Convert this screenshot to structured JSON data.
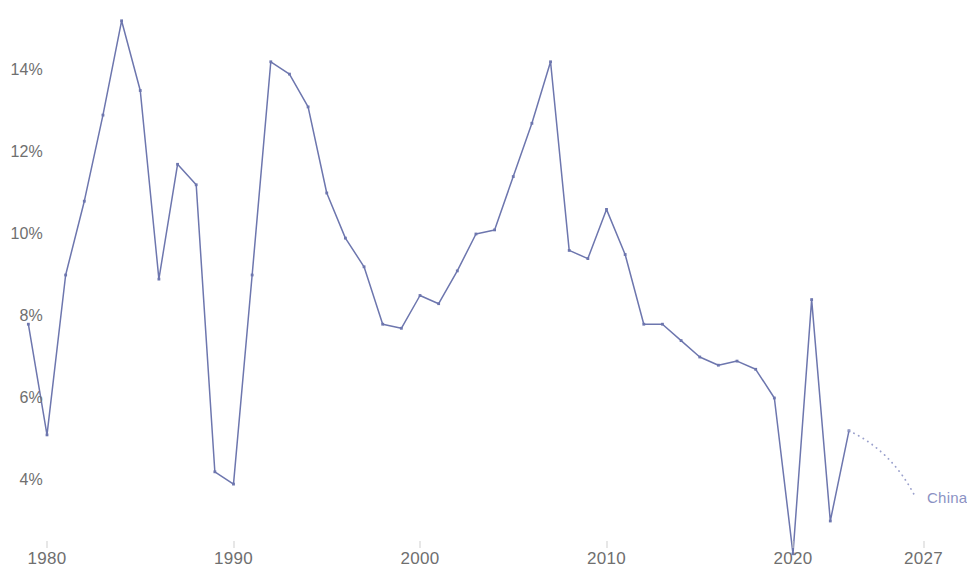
{
  "chart_data": {
    "type": "line",
    "title": "",
    "subtitle": "",
    "xlabel": "",
    "ylabel": "",
    "xlim": [
      1979,
      2028
    ],
    "ylim": [
      2.0,
      15.6
    ],
    "grid": false,
    "legend_position": "inline-right-end",
    "x_ticks": [
      1980,
      1990,
      2000,
      2010,
      2020,
      2027
    ],
    "x_tick_labels": [
      "1980",
      "1990",
      "2000",
      "2010",
      "2020",
      "2027"
    ],
    "y_ticks": [
      4,
      6,
      8,
      10,
      12,
      14
    ],
    "y_tick_labels": [
      "4%",
      "6%",
      "8%",
      "10%",
      "12%",
      "14%"
    ],
    "series": [
      {
        "name": "China",
        "color": "#6d76ae",
        "style": "solid",
        "markers": true,
        "x": [
          1979,
          1980,
          1981,
          1982,
          1983,
          1984,
          1985,
          1986,
          1987,
          1988,
          1989,
          1990,
          1991,
          1992,
          1993,
          1994,
          1995,
          1996,
          1997,
          1998,
          1999,
          2000,
          2001,
          2002,
          2003,
          2004,
          2005,
          2006,
          2007,
          2008,
          2009,
          2010,
          2011,
          2012,
          2013,
          2014,
          2015,
          2016,
          2017,
          2018,
          2019,
          2020,
          2021,
          2022,
          2023
        ],
        "values": [
          7.8,
          5.1,
          9.0,
          10.8,
          12.9,
          15.2,
          13.5,
          8.9,
          11.7,
          11.2,
          4.2,
          3.9,
          9.0,
          14.2,
          13.9,
          13.1,
          11.0,
          9.9,
          9.2,
          7.8,
          7.7,
          8.5,
          8.3,
          9.1,
          10.0,
          10.1,
          11.4,
          12.7,
          14.2,
          9.6,
          9.4,
          10.6,
          9.5,
          7.8,
          7.8,
          7.4,
          7.0,
          6.8,
          6.9,
          6.7,
          6.0,
          2.2,
          8.4,
          3.0,
          5.2
        ]
      }
    ],
    "trend_annotation": {
      "name": "China",
      "style": "dotted",
      "color": "#9aa0cc",
      "from": {
        "x": 2023,
        "y": 5.2
      },
      "to": {
        "x": 2026.6,
        "y": 3.55
      },
      "label": "China",
      "label_color": "#8b92c4"
    }
  }
}
